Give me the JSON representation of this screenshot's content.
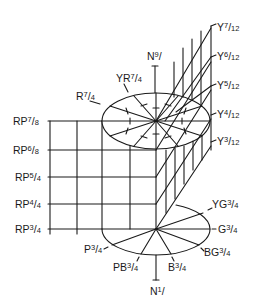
{
  "diagram": {
    "type": "munsell-color-solid-section",
    "ink_color": "#1a1a1a",
    "background": "#ffffff",
    "neutral_axis": {
      "top_label": {
        "hue": "N",
        "value": "9",
        "chroma": "",
        "text": "N9/"
      },
      "bottom_label": {
        "hue": "N",
        "value": "1",
        "chroma": "",
        "text": "N1/"
      }
    },
    "top_ellipse_labels": [
      {
        "id": "r",
        "hue": "R",
        "num": "7",
        "den": "4",
        "text": "R7/4"
      },
      {
        "id": "yr",
        "hue": "YR",
        "num": "7",
        "den": "4",
        "text": "YR7/4"
      }
    ],
    "yellow_scale": [
      {
        "hue": "Y",
        "num": "7",
        "den": "12",
        "text": "Y7/12"
      },
      {
        "hue": "Y",
        "num": "6",
        "den": "12",
        "text": "Y6/12"
      },
      {
        "hue": "Y",
        "num": "5",
        "den": "12",
        "text": "Y5/12"
      },
      {
        "hue": "Y",
        "num": "4",
        "den": "12",
        "text": "Y4/12"
      },
      {
        "hue": "Y",
        "num": "3",
        "den": "12",
        "text": "Y3/12"
      }
    ],
    "red_purple_scale": [
      {
        "hue": "RP",
        "num": "7",
        "den": "8",
        "text": "RP7/8"
      },
      {
        "hue": "RP",
        "num": "6",
        "den": "8",
        "text": "RP6/8"
      },
      {
        "hue": "RP",
        "num": "5",
        "den": "4",
        "text": "RP5/4"
      },
      {
        "hue": "RP",
        "num": "4",
        "den": "4",
        "text": "RP4/4"
      },
      {
        "hue": "RP",
        "num": "3",
        "den": "4",
        "text": "RP3/4"
      }
    ],
    "bottom_ellipse_labels": [
      {
        "id": "yg",
        "hue": "YG",
        "num": "3",
        "den": "4",
        "text": "YG3/4"
      },
      {
        "id": "g",
        "hue": "G",
        "num": "3",
        "den": "4",
        "text": "G3/4"
      },
      {
        "id": "bg",
        "hue": "BG",
        "num": "3",
        "den": "4",
        "text": "BG3/4"
      },
      {
        "id": "b",
        "hue": "B",
        "num": "3",
        "den": "4",
        "text": "B3/4"
      },
      {
        "id": "pb",
        "hue": "PB",
        "num": "3",
        "den": "4",
        "text": "PB3/4"
      },
      {
        "id": "p",
        "hue": "P",
        "num": "3",
        "den": "4",
        "text": "P3/4"
      }
    ]
  }
}
